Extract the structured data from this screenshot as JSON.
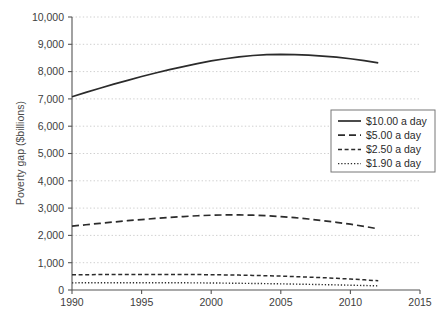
{
  "chart_data": {
    "type": "line",
    "title": "",
    "xlabel": "",
    "ylabel": "Poverty gap ($billions)",
    "xlim": [
      1990,
      2015
    ],
    "ylim": [
      0,
      10000
    ],
    "xticks": [
      "1990",
      "1995",
      "2000",
      "2005",
      "2010",
      "2015"
    ],
    "xtick_values": [
      1990,
      1995,
      2000,
      2005,
      2010,
      2015
    ],
    "yticks": [
      "0",
      "1,000",
      "2,000",
      "3,000",
      "4,000",
      "5,000",
      "6,000",
      "7,000",
      "8,000",
      "9,000",
      "10,000"
    ],
    "ytick_values": [
      0,
      1000,
      2000,
      3000,
      4000,
      5000,
      6000,
      7000,
      8000,
      9000,
      10000
    ],
    "grid": true,
    "grid_style": "dotted",
    "grid_color": "#cfcfcf",
    "legend_position": "center-right",
    "line_color": "#2b2b2b",
    "x": [
      1990,
      1991,
      1992,
      1993,
      1994,
      1995,
      1996,
      1997,
      1998,
      1999,
      2000,
      2001,
      2002,
      2003,
      2004,
      2005,
      2006,
      2007,
      2008,
      2009,
      2010,
      2011,
      2012
    ],
    "series": [
      {
        "name": "$10.00 a day",
        "dash": "none",
        "values": [
          7080,
          7240,
          7390,
          7540,
          7680,
          7820,
          7950,
          8070,
          8180,
          8290,
          8390,
          8470,
          8540,
          8590,
          8620,
          8630,
          8620,
          8600,
          8570,
          8530,
          8470,
          8400,
          8320
        ]
      },
      {
        "name": "$5.00 a day",
        "dash": "dashed-long",
        "values": [
          2340,
          2390,
          2440,
          2490,
          2540,
          2580,
          2620,
          2660,
          2690,
          2720,
          2740,
          2750,
          2750,
          2740,
          2720,
          2690,
          2650,
          2600,
          2540,
          2480,
          2410,
          2330,
          2240
        ]
      },
      {
        "name": "$2.50 a day",
        "dash": "dashed-short",
        "values": [
          555,
          560,
          565,
          568,
          570,
          572,
          572,
          570,
          568,
          565,
          560,
          553,
          545,
          535,
          522,
          508,
          492,
          473,
          452,
          428,
          402,
          372,
          340
        ]
      },
      {
        "name": "$1.90 a day",
        "dash": "dotted",
        "values": [
          262,
          264,
          266,
          267,
          268,
          268,
          267,
          266,
          264,
          261,
          257,
          252,
          246,
          240,
          233,
          225,
          216,
          207,
          197,
          187,
          176,
          164,
          152
        ]
      }
    ]
  },
  "legend": {
    "items": [
      {
        "label": "$10.00 a day"
      },
      {
        "label": "$5.00 a day"
      },
      {
        "label": "$2.50 a day"
      },
      {
        "label": "$1.90 a day"
      }
    ]
  }
}
